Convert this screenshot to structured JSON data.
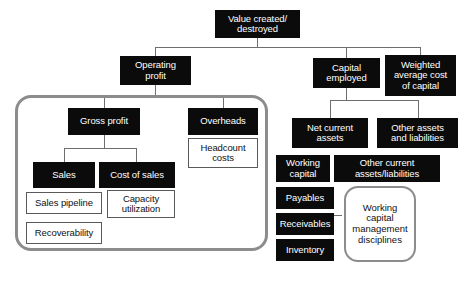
{
  "diagram": {
    "nodes": {
      "value_created": "Value created/\ndestroyed",
      "operating_profit": "Operating\nprofit",
      "capital_employed": "Capital\nemployed",
      "wacc": "Weighted\naverage cost\nof capital",
      "gross_profit": "Gross profit",
      "overheads": "Overheads",
      "headcount_costs": "Headcount\ncosts",
      "sales": "Sales",
      "cost_of_sales": "Cost of sales",
      "sales_pipeline": "Sales pipeline",
      "recoverability": "Recoverability",
      "capacity_utilization": "Capacity\nutilization",
      "net_current_assets": "Net current\nassets",
      "other_assets_liabilities": "Other assets\nand liabilities",
      "working_capital": "Working\ncapital",
      "other_current_assets": "Other current\nassets/liabilities",
      "payables": "Payables",
      "receivables": "Receivables",
      "inventory": "Inventory",
      "wc_disciplines": "Working\ncapital\nmanagement\ndisciplines"
    },
    "colors": {
      "node_fill": "#0b0b0b",
      "node_text": "#ffffff",
      "white_node_fill": "#ffffff",
      "white_node_border": "#5a5a5a",
      "connector": "#6e6e6e",
      "group_border": "#8c8c8c",
      "background": "#ffffff"
    }
  }
}
